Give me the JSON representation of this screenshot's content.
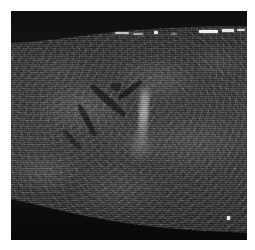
{
  "document": {
    "kind": "grayscale-medical-scan",
    "modality_appearance": "b-scan cross-sectional tomogram",
    "canvas_width": 255,
    "canvas_height": 250,
    "page_background": "#ffffff"
  },
  "scan": {
    "frame": {
      "left": 11,
      "top": 11,
      "width": 236,
      "height": 229,
      "border_color": "#ffffff"
    },
    "palette": {
      "background": "#ffffff",
      "void_dark": "#0d0d0d",
      "tissue_mid": "#3a3a3a",
      "tissue_bright": "#8a8a8a",
      "specular_white": "#f2f2f2",
      "shadow_black": "#080808"
    },
    "regions": [
      {
        "name": "upper-dark-void",
        "description": "dark anechoic band along the top, curved lower margin descending to the left",
        "top": 0,
        "height": 32,
        "fill": "#101010"
      },
      {
        "name": "tissue-body",
        "description": "mottled speckled gray tissue occupying the central field",
        "top": 30,
        "height": 178,
        "fill": "#3e3e3e"
      },
      {
        "name": "lower-dark-shadow",
        "description": "dark wedge at the bottom, boundary rising from lower-left toward the right",
        "top": 196,
        "height": 44,
        "fill": "#0c0c0c"
      }
    ],
    "features": [
      {
        "name": "specular-reflection-1",
        "type": "bright-dash",
        "x": 104,
        "y": 22,
        "width": 14,
        "height": 2
      },
      {
        "name": "specular-reflection-2",
        "type": "bright-dash",
        "x": 122,
        "y": 22,
        "width": 10,
        "height": 2
      },
      {
        "name": "specular-reflection-3",
        "type": "bright-dot",
        "x": 143,
        "y": 21,
        "width": 4,
        "height": 3
      },
      {
        "name": "specular-reflection-4",
        "type": "bright-dash",
        "x": 189,
        "y": 20,
        "width": 18,
        "height": 3
      },
      {
        "name": "specular-reflection-5",
        "type": "bright-dash",
        "x": 211,
        "y": 19,
        "width": 12,
        "height": 3
      },
      {
        "name": "specular-reflection-6",
        "type": "bright-dash",
        "x": 226,
        "y": 19,
        "width": 8,
        "height": 2
      },
      {
        "name": "vessel-branch-left",
        "type": "dark-linear-structure",
        "x": 74,
        "y": 88,
        "width": 44,
        "height": 7,
        "rotation_deg": 44
      },
      {
        "name": "vessel-branch-right",
        "type": "dark-linear-structure",
        "x": 106,
        "y": 78,
        "width": 30,
        "height": 6,
        "rotation_deg": -34
      },
      {
        "name": "vessel-branch-lower",
        "type": "dark-linear-structure",
        "x": 62,
        "y": 108,
        "width": 34,
        "height": 6,
        "rotation_deg": 58
      },
      {
        "name": "bright-vertical-streak",
        "type": "hyperechoic-streak",
        "x": 128,
        "y": 74,
        "width": 9,
        "height": 62
      },
      {
        "name": "isolated-bright-speck",
        "type": "bright-dot",
        "x": 216,
        "y": 206,
        "width": 3,
        "height": 4
      }
    ],
    "artifacts": {
      "horizontal_scanlines": "true",
      "speckle_noise": "true",
      "vignette": "true"
    }
  }
}
